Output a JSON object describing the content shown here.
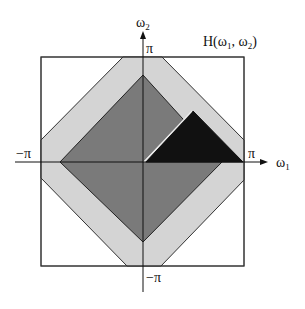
{
  "diagram": {
    "title_parts": {
      "H": "H(",
      "w1": "ω",
      "sub1": "1",
      "comma": ", ",
      "w2": "ω",
      "sub2": "2",
      "close": ")"
    },
    "axes": {
      "horizontal": {
        "label": "ω",
        "label_sub": "1",
        "pos_tick": "π",
        "neg_tick": "−π"
      },
      "vertical": {
        "label": "ω",
        "label_sub": "2",
        "pos_tick": "π",
        "neg_tick": "−π"
      }
    },
    "regions": [
      {
        "name": "outer-square",
        "fill": "#ffffff",
        "description": "frequency plane [-π, π]²"
      },
      {
        "name": "transition-band",
        "fill": "#d4d4d4",
        "description": "light gray octagonal band"
      },
      {
        "name": "passband-diamond",
        "fill": "#7a7a7a",
        "description": "dark gray diamond region"
      },
      {
        "name": "highlighted-triangle",
        "fill": "#111111",
        "description": "black triangle in first quadrant"
      }
    ],
    "colors": {
      "stroke": "#222222",
      "light_band": "#d4d4d4",
      "diamond": "#7a7a7a",
      "triangle": "#111111",
      "background": "#ffffff"
    }
  }
}
